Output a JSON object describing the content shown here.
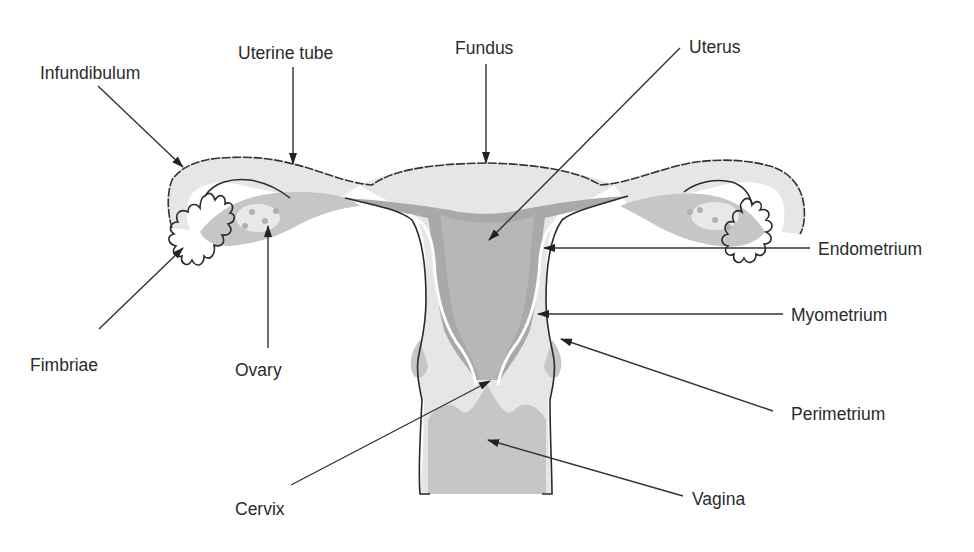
{
  "diagram": {
    "colors": {
      "background": "#ffffff",
      "outline": "#2a2a2a",
      "tissue_light": "#e6e6e6",
      "tissue_mid": "#c6c6c6",
      "tissue_dark": "#a9a9a9",
      "label_text": "#2b2b2b"
    },
    "labels": [
      {
        "id": "infundibulum",
        "text": "Infundibulum",
        "x": 40,
        "y": 79,
        "arrow": {
          "x1": 98,
          "y1": 86,
          "x2": 183,
          "y2": 167
        }
      },
      {
        "id": "uterine-tube",
        "text": "Uterine tube",
        "x": 238,
        "y": 59,
        "arrow": {
          "x1": 293,
          "y1": 67,
          "x2": 293,
          "y2": 164
        }
      },
      {
        "id": "fundus",
        "text": "Fundus",
        "x": 455,
        "y": 54,
        "arrow": {
          "x1": 486,
          "y1": 64,
          "x2": 486,
          "y2": 163
        }
      },
      {
        "id": "uterus",
        "text": "Uterus",
        "x": 689,
        "y": 53,
        "arrow": {
          "x1": 680,
          "y1": 48,
          "x2": 489,
          "y2": 240
        }
      },
      {
        "id": "endometrium",
        "text": "Endometrium",
        "x": 818,
        "y": 255,
        "arrow": {
          "x1": 810,
          "y1": 248,
          "x2": 544,
          "y2": 248
        }
      },
      {
        "id": "myometrium",
        "text": "Myometrium",
        "x": 791,
        "y": 321,
        "arrow": {
          "x1": 783,
          "y1": 314,
          "x2": 538,
          "y2": 314
        }
      },
      {
        "id": "perimetrium",
        "text": "Perimetrium",
        "x": 791,
        "y": 420,
        "arrow": {
          "x1": 773,
          "y1": 411,
          "x2": 561,
          "y2": 339
        }
      },
      {
        "id": "vagina",
        "text": "Vagina",
        "x": 692,
        "y": 505,
        "arrow": {
          "x1": 683,
          "y1": 496,
          "x2": 488,
          "y2": 440
        }
      },
      {
        "id": "cervix",
        "text": "Cervix",
        "x": 235,
        "y": 515,
        "arrow": {
          "x1": 291,
          "y1": 485,
          "x2": 490,
          "y2": 381
        }
      },
      {
        "id": "ovary",
        "text": "Ovary",
        "x": 235,
        "y": 376,
        "arrow": {
          "x1": 268,
          "y1": 348,
          "x2": 268,
          "y2": 226
        }
      },
      {
        "id": "fimbriae",
        "text": "Fimbriae",
        "x": 30,
        "y": 371,
        "arrow": {
          "x1": 99,
          "y1": 329,
          "x2": 183,
          "y2": 248
        }
      }
    ]
  }
}
